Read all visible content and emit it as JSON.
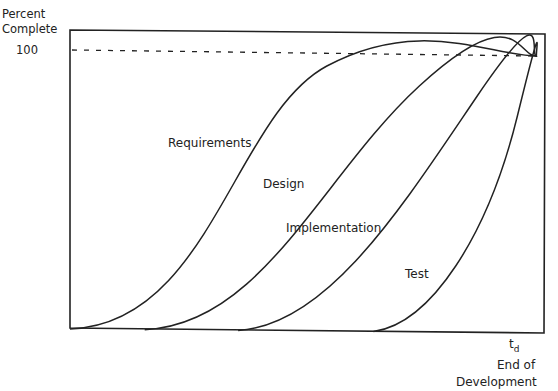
{
  "chart_data": {
    "type": "line",
    "title": "",
    "ylabel": "Percent Complete",
    "xlabel": "End of Development",
    "y_tick_labels": [
      "100"
    ],
    "x_tick_labels": [
      "t_d"
    ],
    "x_tick_main": "t",
    "x_tick_sub": "d",
    "ylim": [
      0,
      100
    ],
    "xlim": [
      0,
      1
    ],
    "reference_line": {
      "y": 100,
      "style": "dashed"
    },
    "grid": false,
    "legend": "none (inline labels)",
    "series": [
      {
        "name": "Requirements",
        "start_x": 0.0,
        "end_x": 1.0,
        "values_note": "S-curve from 0% to 100%"
      },
      {
        "name": "Design",
        "start_x": 0.16,
        "end_x": 1.0,
        "values_note": "S-curve from 0% to 100%"
      },
      {
        "name": "Implementation",
        "start_x": 0.36,
        "end_x": 1.0,
        "values_note": "S-curve from 0% to 100%"
      },
      {
        "name": "Test",
        "start_x": 0.65,
        "end_x": 1.0,
        "values_note": "S-curve from 0% to 100%"
      }
    ]
  },
  "labels": {
    "y_line1": "Percent",
    "y_line2": "Complete",
    "y_tick": "100",
    "x_line1": "End of",
    "x_line2": "Development",
    "requirements": "Requirements",
    "design": "Design",
    "implementation": "Implementation",
    "test": "Test"
  }
}
